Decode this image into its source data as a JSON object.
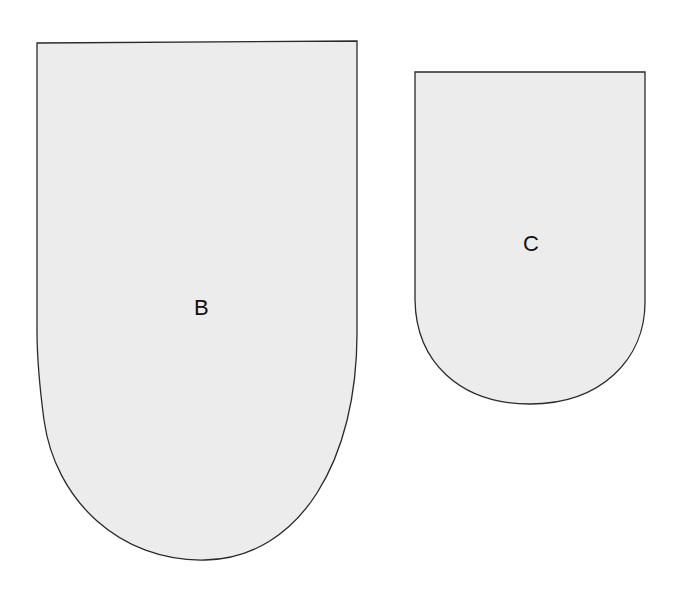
{
  "diagram": {
    "background_color": "#ffffff",
    "fill_color": "#ececec",
    "stroke_color": "#2a2a2a",
    "pieces": [
      {
        "id": "B",
        "label": "B",
        "size": "large"
      },
      {
        "id": "C",
        "label": "C",
        "size": "small"
      }
    ]
  }
}
